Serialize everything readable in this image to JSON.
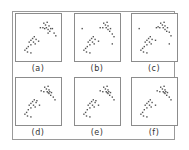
{
  "figure": {
    "panel_labels": [
      "(a)",
      "(b)",
      "(c)",
      "(d)",
      "(e)",
      "(f)"
    ],
    "colors": {
      "point": "#555555",
      "frame": "#8c8c8c",
      "outer_frame": "#9a9a9a"
    }
  },
  "chart_data": [
    {
      "type": "scatter",
      "title": "(a)",
      "xlabel": "",
      "ylabel": "",
      "grid": false,
      "xlim": [
        0,
        100
      ],
      "ylim": [
        0,
        100
      ],
      "series": [
        {
          "name": "points",
          "points": [
            [
              60,
              84
            ],
            [
              64,
              80
            ],
            [
              68,
              86
            ],
            [
              72,
              78
            ],
            [
              58,
              74
            ],
            [
              66,
              74
            ],
            [
              70,
              70
            ],
            [
              76,
              72
            ],
            [
              74,
              66
            ],
            [
              80,
              72
            ],
            [
              84,
              62
            ],
            [
              88,
              56
            ],
            [
              62,
              72
            ],
            [
              52,
              74
            ],
            [
              70,
              62
            ],
            [
              38,
              54
            ],
            [
              34,
              50
            ],
            [
              30,
              46
            ],
            [
              42,
              48
            ],
            [
              26,
              42
            ],
            [
              36,
              42
            ],
            [
              30,
              36
            ],
            [
              24,
              32
            ],
            [
              20,
              28
            ],
            [
              16,
              24
            ],
            [
              22,
              20
            ],
            [
              30,
              18
            ],
            [
              48,
              44
            ],
            [
              40,
              38
            ]
          ]
        }
      ]
    },
    {
      "type": "scatter",
      "title": "(b)",
      "xlabel": "",
      "ylabel": "",
      "grid": false,
      "xlim": [
        0,
        100
      ],
      "ylim": [
        0,
        100
      ],
      "series": [
        {
          "name": "points",
          "points": [
            [
              62,
              84
            ],
            [
              66,
              80
            ],
            [
              70,
              86
            ],
            [
              72,
              78
            ],
            [
              60,
              74
            ],
            [
              68,
              74
            ],
            [
              72,
              70
            ],
            [
              78,
              72
            ],
            [
              76,
              66
            ],
            [
              82,
              60
            ],
            [
              86,
              54
            ],
            [
              54,
              74
            ],
            [
              12,
              72
            ],
            [
              82,
              38
            ],
            [
              38,
              54
            ],
            [
              34,
              50
            ],
            [
              30,
              46
            ],
            [
              42,
              48
            ],
            [
              26,
              42
            ],
            [
              36,
              42
            ],
            [
              30,
              36
            ],
            [
              24,
              32
            ],
            [
              20,
              28
            ],
            [
              16,
              24
            ],
            [
              22,
              20
            ],
            [
              30,
              18
            ],
            [
              50,
              44
            ],
            [
              40,
              38
            ]
          ]
        }
      ]
    },
    {
      "type": "scatter",
      "title": "(c)",
      "xlabel": "",
      "ylabel": "",
      "grid": false,
      "xlim": [
        0,
        100
      ],
      "ylim": [
        0,
        100
      ],
      "series": [
        {
          "name": "points",
          "points": [
            [
              62,
              84
            ],
            [
              66,
              80
            ],
            [
              70,
              86
            ],
            [
              72,
              78
            ],
            [
              60,
              74
            ],
            [
              68,
              74
            ],
            [
              72,
              70
            ],
            [
              78,
              74
            ],
            [
              76,
              66
            ],
            [
              82,
              64
            ],
            [
              86,
              56
            ],
            [
              52,
              74
            ],
            [
              56,
              76
            ],
            [
              12,
              72
            ],
            [
              82,
              38
            ],
            [
              38,
              54
            ],
            [
              34,
              50
            ],
            [
              30,
              46
            ],
            [
              42,
              48
            ],
            [
              26,
              42
            ],
            [
              36,
              42
            ],
            [
              30,
              36
            ],
            [
              24,
              32
            ],
            [
              20,
              28
            ],
            [
              16,
              24
            ],
            [
              22,
              20
            ],
            [
              30,
              18
            ],
            [
              50,
              46
            ],
            [
              40,
              38
            ]
          ]
        }
      ]
    },
    {
      "type": "scatter",
      "title": "(d)",
      "xlabel": "",
      "ylabel": "",
      "grid": false,
      "xlim": [
        0,
        100
      ],
      "ylim": [
        0,
        100
      ],
      "series": [
        {
          "name": "points",
          "points": [
            [
              62,
              84
            ],
            [
              66,
              80
            ],
            [
              70,
              86
            ],
            [
              72,
              78
            ],
            [
              60,
              74
            ],
            [
              68,
              74
            ],
            [
              72,
              70
            ],
            [
              78,
              72
            ],
            [
              76,
              66
            ],
            [
              82,
              62
            ],
            [
              86,
              56
            ],
            [
              54,
              76
            ],
            [
              70,
              72
            ],
            [
              74,
              74
            ],
            [
              38,
              56
            ],
            [
              34,
              52
            ],
            [
              30,
              48
            ],
            [
              42,
              50
            ],
            [
              26,
              44
            ],
            [
              36,
              44
            ],
            [
              30,
              38
            ],
            [
              24,
              34
            ],
            [
              20,
              28
            ],
            [
              16,
              24
            ],
            [
              22,
              20
            ],
            [
              30,
              18
            ],
            [
              50,
              44
            ],
            [
              40,
              40
            ],
            [
              44,
              54
            ]
          ]
        }
      ]
    },
    {
      "type": "scatter",
      "title": "(e)",
      "xlabel": "",
      "ylabel": "",
      "grid": false,
      "xlim": [
        0,
        100
      ],
      "ylim": [
        0,
        100
      ],
      "series": [
        {
          "name": "points",
          "points": [
            [
              62,
              84
            ],
            [
              66,
              80
            ],
            [
              70,
              86
            ],
            [
              72,
              78
            ],
            [
              60,
              74
            ],
            [
              68,
              74
            ],
            [
              72,
              70
            ],
            [
              78,
              72
            ],
            [
              76,
              66
            ],
            [
              82,
              62
            ],
            [
              86,
              56
            ],
            [
              54,
              76
            ],
            [
              70,
              72
            ],
            [
              74,
              74
            ],
            [
              38,
              56
            ],
            [
              34,
              52
            ],
            [
              30,
              48
            ],
            [
              42,
              50
            ],
            [
              26,
              44
            ],
            [
              36,
              44
            ],
            [
              30,
              38
            ],
            [
              24,
              34
            ],
            [
              20,
              28
            ],
            [
              16,
              24
            ],
            [
              22,
              20
            ],
            [
              30,
              18
            ],
            [
              50,
              44
            ],
            [
              40,
              40
            ],
            [
              44,
              54
            ]
          ]
        }
      ]
    },
    {
      "type": "scatter",
      "title": "(f)",
      "xlabel": "",
      "ylabel": "",
      "grid": false,
      "xlim": [
        0,
        100
      ],
      "ylim": [
        0,
        100
      ],
      "series": [
        {
          "name": "points",
          "points": [
            [
              62,
              84
            ],
            [
              66,
              80
            ],
            [
              70,
              86
            ],
            [
              72,
              78
            ],
            [
              60,
              74
            ],
            [
              68,
              74
            ],
            [
              72,
              70
            ],
            [
              78,
              72
            ],
            [
              76,
              66
            ],
            [
              82,
              62
            ],
            [
              86,
              56
            ],
            [
              54,
              76
            ],
            [
              70,
              72
            ],
            [
              74,
              74
            ],
            [
              38,
              56
            ],
            [
              34,
              52
            ],
            [
              30,
              48
            ],
            [
              42,
              50
            ],
            [
              26,
              44
            ],
            [
              36,
              44
            ],
            [
              30,
              38
            ],
            [
              24,
              34
            ],
            [
              20,
              28
            ],
            [
              16,
              24
            ],
            [
              22,
              20
            ],
            [
              30,
              18
            ],
            [
              50,
              44
            ],
            [
              40,
              40
            ]
          ]
        }
      ]
    }
  ]
}
